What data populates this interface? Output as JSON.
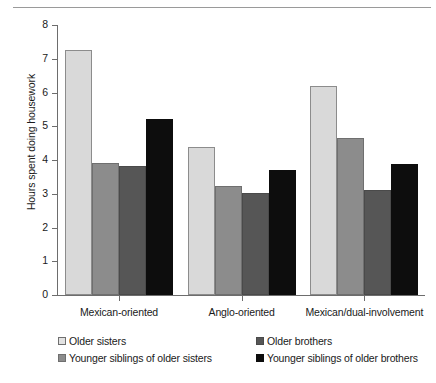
{
  "chart_data": {
    "type": "bar",
    "title": "",
    "subtitle": "",
    "xlabel": "",
    "ylabel": "Hours spent doing housework",
    "categories": [
      "Mexican-oriented",
      "Anglo-oriented",
      "Mexican/dual-involvement"
    ],
    "series": [
      {
        "name": "Older sisters",
        "color": "#d9d9d9",
        "values": [
          7.25,
          4.4,
          6.18
        ]
      },
      {
        "name": "Younger siblings of older sisters",
        "color": "#8c8c8c",
        "values": [
          3.92,
          3.23,
          4.66
        ]
      },
      {
        "name": "Older brothers",
        "color": "#565656",
        "values": [
          3.82,
          3.03,
          3.12
        ]
      },
      {
        "name": "Younger siblings of older brothers",
        "color": "#0d0d0d",
        "values": [
          5.22,
          3.7,
          3.88
        ]
      }
    ],
    "ylim": [
      0,
      8
    ],
    "yticks": [
      "0",
      "1",
      "2",
      "3",
      "4",
      "5",
      "6",
      "7",
      "8"
    ],
    "grid": false,
    "legend_position": "bottom",
    "legend_order": [
      "Older sisters",
      "Older brothers",
      "Younger siblings of older sisters",
      "Younger siblings of older brothers"
    ]
  }
}
